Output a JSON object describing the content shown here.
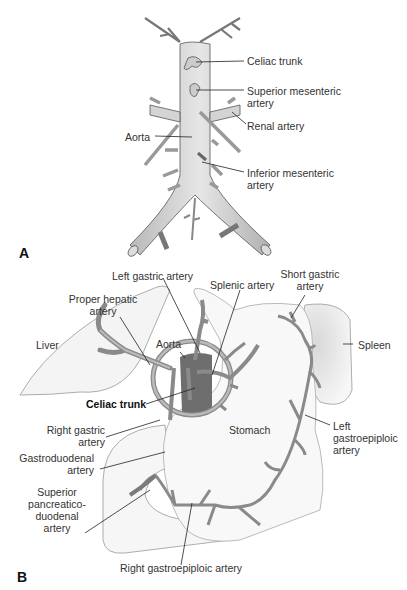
{
  "panel_a": {
    "letter": "A",
    "labels": {
      "celiac_trunk": "Celiac trunk",
      "superior_mesenteric_1": "Superior mesenteric",
      "superior_mesenteric_2": "artery",
      "renal_artery": "Renal artery",
      "aorta": "Aorta",
      "inferior_mesenteric_1": "Inferior mesenteric",
      "inferior_mesenteric_2": "artery"
    }
  },
  "panel_b": {
    "letter": "B",
    "labels": {
      "left_gastric": "Left gastric artery",
      "splenic": "Splenic artery",
      "short_gastric_1": "Short gastric",
      "short_gastric_2": "artery",
      "proper_hepatic_1": "Proper hepatic",
      "proper_hepatic_2": "artery",
      "liver": "Liver",
      "aorta": "Aorta",
      "spleen": "Spleen",
      "celiac_trunk": "Celiac trunk",
      "right_gastric_1": "Right gastric",
      "right_gastric_2": "artery",
      "stomach": "Stomach",
      "left_gastroepiploic_1": "Left",
      "left_gastroepiploic_2": "gastroepiploic",
      "left_gastroepiploic_3": "artery",
      "gastroduodenal_1": "Gastroduodenal",
      "gastroduodenal_2": "artery",
      "sup_pancreatico_1": "Superior",
      "sup_pancreatico_2": "pancreatico-",
      "sup_pancreatico_3": "duodenal",
      "sup_pancreatico_4": "artery",
      "right_gastroepiploic": "Right gastroepiploic artery"
    }
  },
  "colors": {
    "vessel_fill": "#d8d8d8",
    "vessel_stroke": "#555555",
    "artery_fill": "#9a9a9a",
    "aorta_dark": "#6e6e6e",
    "organ_stroke": "#999999",
    "leader": "#222222"
  }
}
